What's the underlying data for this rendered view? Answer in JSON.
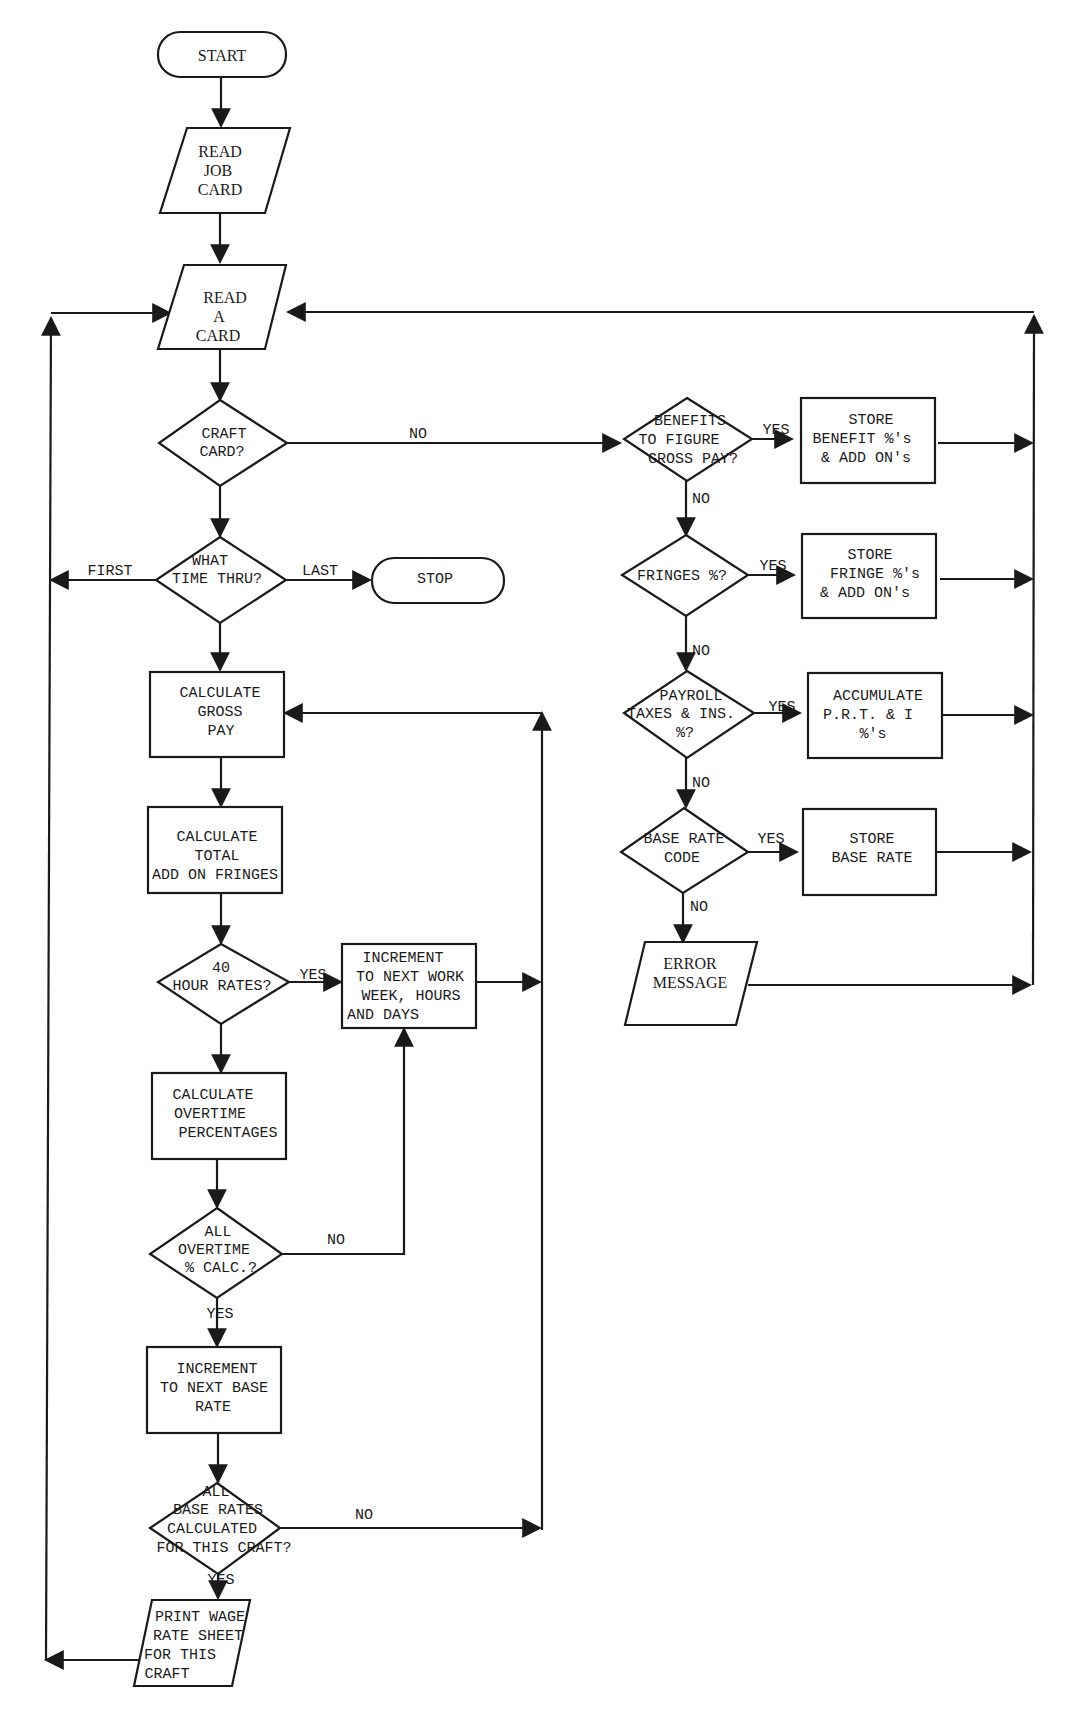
{
  "diagram": {
    "type": "flowchart",
    "nodes": {
      "start": {
        "shape": "terminal",
        "lines": [
          "START"
        ]
      },
      "read_job_card": {
        "shape": "input",
        "lines": [
          "READ",
          "JOB",
          "CARD"
        ]
      },
      "read_a_card": {
        "shape": "input",
        "lines": [
          "READ",
          "A",
          "CARD"
        ]
      },
      "craft_card": {
        "shape": "decision",
        "lines": [
          "CRAFT",
          "CARD?"
        ]
      },
      "what_time_thru": {
        "shape": "decision",
        "lines": [
          "WHAT",
          "TIME THRU?"
        ]
      },
      "stop": {
        "shape": "terminal",
        "lines": [
          "STOP"
        ]
      },
      "calc_gross_pay": {
        "shape": "process",
        "lines": [
          "CALCULATE",
          "GROSS",
          "PAY"
        ]
      },
      "calc_total_addon": {
        "shape": "process",
        "lines": [
          "CALCULATE",
          "TOTAL",
          "ADD ON FRINGES"
        ]
      },
      "forty_hour_rates": {
        "shape": "decision",
        "lines": [
          "40",
          "HOUR RATES?"
        ]
      },
      "increment_work_week": {
        "shape": "process",
        "lines": [
          "INCREMENT",
          "TO NEXT WORK",
          "WEEK, HOURS",
          "AND DAYS"
        ]
      },
      "calc_overtime_pct": {
        "shape": "process",
        "lines": [
          "CALCULATE",
          "OVERTIME",
          "PERCENTAGES"
        ]
      },
      "all_overtime_calc": {
        "shape": "decision",
        "lines": [
          "ALL",
          "OVERTIME",
          "% CALC.?"
        ]
      },
      "increment_base_rate": {
        "shape": "process",
        "lines": [
          "INCREMENT",
          "TO NEXT BASE",
          "RATE"
        ]
      },
      "all_base_rates_calc": {
        "shape": "decision",
        "lines": [
          "ALL",
          "BASE RATES",
          "CALCULATED",
          "FOR THIS CRAFT?"
        ]
      },
      "print_wage_sheet": {
        "shape": "output",
        "lines": [
          "PRINT WAGE",
          "RATE SHEET",
          "FOR THIS",
          "CRAFT"
        ]
      },
      "benefits_gross_pay": {
        "shape": "decision",
        "lines": [
          "BENEFITS",
          "TO FIGURE",
          "GROSS PAY?"
        ]
      },
      "store_benefit": {
        "shape": "process",
        "lines": [
          "STORE",
          "BENEFIT %'s",
          "& ADD ON's"
        ]
      },
      "fringes_pct": {
        "shape": "decision",
        "lines": [
          "FRINGES %?"
        ]
      },
      "store_fringe": {
        "shape": "process",
        "lines": [
          "STORE",
          "FRINGE %'s",
          "& ADD ON's"
        ]
      },
      "payroll_taxes": {
        "shape": "decision",
        "lines": [
          "PAYROLL",
          "TAXES & INS.",
          "%?"
        ]
      },
      "accumulate_prt": {
        "shape": "process",
        "lines": [
          "ACCUMULATE",
          "P.R.T. & I",
          "%'s"
        ]
      },
      "base_rate_code": {
        "shape": "decision",
        "lines": [
          "BASE RATE",
          "CODE"
        ]
      },
      "store_base_rate": {
        "shape": "process",
        "lines": [
          "STORE",
          "BASE RATE"
        ]
      },
      "error_message": {
        "shape": "output",
        "lines": [
          "ERROR",
          "MESSAGE"
        ]
      }
    },
    "edge_labels": {
      "craft_no": "NO",
      "first": "FIRST",
      "last": "LAST",
      "forty_yes": "YES",
      "overtime_no": "NO",
      "overtime_yes": "YES",
      "base_rates_no": "NO",
      "base_rates_yes": "YES",
      "benefits_yes": "YES",
      "benefits_no": "NO",
      "fringes_yes": "YES",
      "fringes_no": "NO",
      "payroll_yes": "YES",
      "payroll_no": "NO",
      "base_code_yes": "YES",
      "base_code_no": "NO"
    },
    "edges": [
      [
        "start",
        "read_job_card"
      ],
      [
        "read_job_card",
        "read_a_card"
      ],
      [
        "read_a_card",
        "craft_card"
      ],
      [
        "craft_card",
        "what_time_thru",
        ""
      ],
      [
        "craft_card",
        "benefits_gross_pay",
        "NO"
      ],
      [
        "what_time_thru",
        "read_a_card",
        "FIRST"
      ],
      [
        "what_time_thru",
        "stop",
        "LAST"
      ],
      [
        "what_time_thru",
        "calc_gross_pay"
      ],
      [
        "calc_gross_pay",
        "calc_total_addon"
      ],
      [
        "calc_total_addon",
        "forty_hour_rates"
      ],
      [
        "forty_hour_rates",
        "increment_work_week",
        "YES"
      ],
      [
        "forty_hour_rates",
        "calc_overtime_pct"
      ],
      [
        "increment_work_week",
        "calc_gross_pay"
      ],
      [
        "calc_overtime_pct",
        "all_overtime_calc"
      ],
      [
        "all_overtime_calc",
        "increment_work_week",
        "NO"
      ],
      [
        "all_overtime_calc",
        "increment_base_rate",
        "YES"
      ],
      [
        "increment_base_rate",
        "all_base_rates_calc"
      ],
      [
        "all_base_rates_calc",
        "calc_gross_pay",
        "NO"
      ],
      [
        "all_base_rates_calc",
        "print_wage_sheet",
        "YES"
      ],
      [
        "print_wage_sheet",
        "read_a_card"
      ],
      [
        "benefits_gross_pay",
        "store_benefit",
        "YES"
      ],
      [
        "benefits_gross_pay",
        "fringes_pct",
        "NO"
      ],
      [
        "fringes_pct",
        "store_fringe",
        "YES"
      ],
      [
        "fringes_pct",
        "payroll_taxes",
        "NO"
      ],
      [
        "payroll_taxes",
        "accumulate_prt",
        "YES"
      ],
      [
        "payroll_taxes",
        "base_rate_code",
        "NO"
      ],
      [
        "base_rate_code",
        "store_base_rate",
        "YES"
      ],
      [
        "base_rate_code",
        "error_message",
        "NO"
      ],
      [
        "store_benefit",
        "read_a_card"
      ],
      [
        "store_fringe",
        "read_a_card"
      ],
      [
        "accumulate_prt",
        "read_a_card"
      ],
      [
        "store_base_rate",
        "read_a_card"
      ],
      [
        "error_message",
        "read_a_card"
      ]
    ]
  }
}
